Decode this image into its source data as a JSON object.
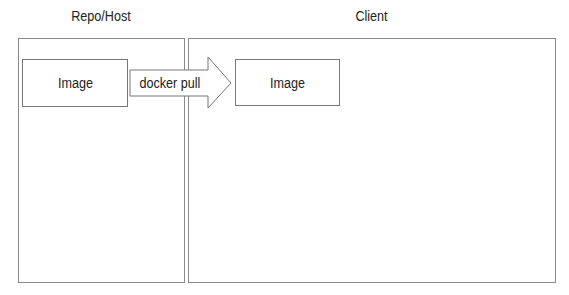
{
  "diagram": {
    "panels": [
      {
        "id": "repo-host",
        "title": "Repo/Host"
      },
      {
        "id": "client",
        "title": "Client"
      }
    ],
    "nodes": [
      {
        "id": "image-source",
        "label": "Image",
        "panel": "repo-host"
      },
      {
        "id": "image-target",
        "label": "Image",
        "panel": "client"
      }
    ],
    "edges": [
      {
        "from": "image-source",
        "to": "image-target",
        "label": "docker pull",
        "style": "block-arrow"
      }
    ],
    "colors": {
      "border": "#8a8a8a",
      "text": "#222222",
      "background": "#ffffff"
    }
  }
}
